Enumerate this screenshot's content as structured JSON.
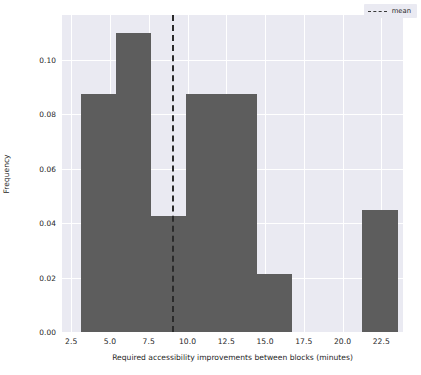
{
  "chart_data": {
    "type": "bar",
    "chart_subtype": "histogram",
    "title": "",
    "xlabel": "Required accessibility improvements between blocks (minutes)",
    "ylabel": "Frequency",
    "xlim": [
      1.9,
      23.9
    ],
    "ylim": [
      0.0,
      0.1165
    ],
    "grid": true,
    "grid_color": "#ffffff",
    "plot_background": "#eaeaf2",
    "bar_color": "#5d5d5d",
    "xticks": [
      2.5,
      5.0,
      7.5,
      10.0,
      12.5,
      15.0,
      17.5,
      20.0,
      22.5
    ],
    "xtick_labels": [
      "2.5",
      "5.0",
      "7.5",
      "10.0",
      "12.5",
      "15.0",
      "17.5",
      "20.0",
      "22.5"
    ],
    "yticks": [
      0.0,
      0.02,
      0.04,
      0.06,
      0.08,
      0.1
    ],
    "ytick_labels": [
      "0.00",
      "0.02",
      "0.04",
      "0.06",
      "0.08",
      "0.10"
    ],
    "bins": [
      {
        "left": 3.12,
        "right": 5.39,
        "value": 0.0873
      },
      {
        "left": 5.39,
        "right": 7.66,
        "value": 0.11
      },
      {
        "left": 7.66,
        "right": 9.93,
        "value": 0.0425
      },
      {
        "left": 9.93,
        "right": 12.2,
        "value": 0.0873
      },
      {
        "left": 12.2,
        "right": 14.47,
        "value": 0.0873
      },
      {
        "left": 14.47,
        "right": 16.74,
        "value": 0.0215
      },
      {
        "left": 16.74,
        "right": 19.01,
        "value": 0.0
      },
      {
        "left": 19.01,
        "right": 21.28,
        "value": 0.0
      },
      {
        "left": 21.28,
        "right": 23.55,
        "value": 0.0449
      }
    ],
    "annotations": [
      {
        "name": "mean",
        "type": "vline",
        "x": 9.0,
        "style": "dashed",
        "color": "#2b2b2b"
      }
    ],
    "legend": {
      "position": "upper right",
      "entries": [
        {
          "label": "mean",
          "marker": "dashed-line",
          "color": "#3a3a3a"
        }
      ]
    }
  }
}
